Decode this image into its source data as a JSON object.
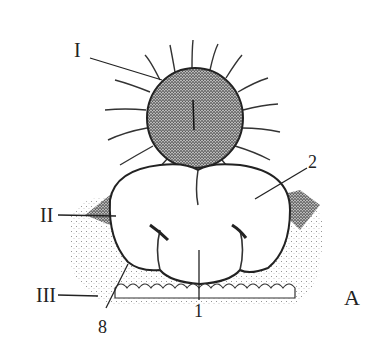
{
  "figure": {
    "panel_label": "A",
    "labels": {
      "roman_1": "I",
      "roman_2": "II",
      "roman_3": "III",
      "num_1_bottom": "1",
      "num_1_center": "1",
      "num_2": "2",
      "num_8": "8"
    },
    "colors": {
      "ink": "#222222",
      "background": "#ffffff",
      "stipple": "#555555"
    }
  }
}
